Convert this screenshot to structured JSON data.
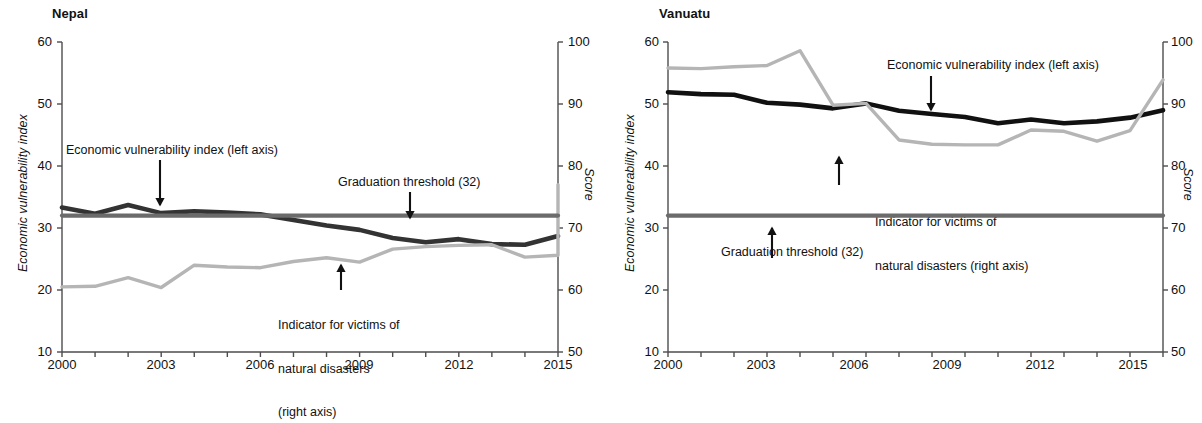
{
  "figure": {
    "background": "#ffffff",
    "series_colors": {
      "evi_dark": "#333333",
      "indicator_grey": "#b5b5b5",
      "threshold_grey": "#6b6b6b",
      "axis": "#4d4d4d"
    }
  },
  "panels": [
    {
      "id": "nepal",
      "title": "Nepal",
      "y_left_title": "Economic vulnerability index",
      "y_right_title": "Score",
      "annotations": [
        {
          "id": "evi",
          "text": "Economic vulnerability index (left axis)"
        },
        {
          "id": "threshold",
          "text": "Graduation threshold (32)"
        },
        {
          "id": "indicator",
          "line1": "Indicator for victims of",
          "line2": "natural disasters",
          "line3": "(right axis)"
        }
      ]
    },
    {
      "id": "vanuatu",
      "title": "Vanuatu",
      "y_left_title": "Economic vulnerability index",
      "y_right_title": "Score",
      "annotations": [
        {
          "id": "evi",
          "text": "Economic vulnerability index (left axis)"
        },
        {
          "id": "threshold",
          "text": "Graduation threshold (32)"
        },
        {
          "id": "indicator",
          "line1": "Indicator for victims of",
          "line2": "natural disasters (right axis)"
        }
      ]
    }
  ],
  "chart_data": [
    {
      "type": "line",
      "title": "Nepal",
      "xlabel": "",
      "ylabel": "Economic vulnerability index",
      "y2label": "Score",
      "xlim": [
        2000,
        2015
      ],
      "ylim": [
        10,
        60
      ],
      "y2lim": [
        50,
        100
      ],
      "yticks": [
        10,
        20,
        30,
        40,
        50,
        60
      ],
      "y2ticks": [
        50,
        60,
        70,
        80,
        90,
        100
      ],
      "xticks": [
        2000,
        2001,
        2002,
        2003,
        2004,
        2005,
        2006,
        2007,
        2008,
        2009,
        2010,
        2011,
        2012,
        2013,
        2014,
        2015
      ],
      "xticklabels": [
        "2000",
        "",
        "",
        "2003",
        "",
        "",
        "2006",
        "",
        "",
        "2009",
        "",
        "",
        "2012",
        "",
        "",
        "2015"
      ],
      "grid": false,
      "legend": "annotations-inline",
      "x": [
        2000,
        2001,
        2002,
        2003,
        2004,
        2005,
        2006,
        2007,
        2008,
        2009,
        2010,
        2011,
        2012,
        2013,
        2014,
        2015
      ],
      "series": [
        {
          "name": "Economic vulnerability index (left axis)",
          "axis": "left",
          "color": "#333333",
          "values": [
            33.3,
            32.3,
            33.7,
            32.4,
            32.7,
            32.5,
            32.2,
            31.3,
            30.4,
            29.7,
            28.4,
            27.7,
            28.2,
            27.4,
            27.3,
            28.7
          ]
        },
        {
          "name": "Indicator for victims of natural disasters (right axis)",
          "axis": "right",
          "color": "#b5b5b5",
          "values": [
            60.5,
            60.6,
            62.0,
            60.4,
            64.0,
            63.7,
            63.6,
            64.6,
            65.2,
            64.5,
            66.6,
            67.0,
            67.2,
            67.3,
            65.3,
            65.6
          ]
        },
        {
          "name": "Graduation threshold (32)",
          "axis": "left",
          "color": "#6b6b6b",
          "constant": 32,
          "values": [
            32,
            32,
            32,
            32,
            32,
            32,
            32,
            32,
            32,
            32,
            32,
            32,
            32,
            32,
            32,
            32
          ]
        }
      ],
      "extra_segment_note": "grey indicator rises steeply from 65.6 in 2014 to 77.0 in 2015",
      "indicator_2015": 77.0
    },
    {
      "type": "line",
      "title": "Vanuatu",
      "xlabel": "",
      "ylabel": "Economic vulnerability index",
      "y2label": "Score",
      "xlim": [
        2000,
        2015
      ],
      "ylim": [
        10,
        60
      ],
      "y2lim": [
        50,
        100
      ],
      "yticks": [
        10,
        20,
        30,
        40,
        50,
        60
      ],
      "y2ticks": [
        50,
        60,
        70,
        80,
        90,
        100
      ],
      "xticks": [
        2000,
        2001,
        2002,
        2003,
        2004,
        2005,
        2006,
        2007,
        2008,
        2009,
        2010,
        2011,
        2012,
        2013,
        2014,
        2015
      ],
      "xticklabels": [
        "2000",
        "",
        "",
        "2003",
        "",
        "",
        "2006",
        "",
        "",
        "2009",
        "",
        "",
        "2012",
        "",
        "",
        "2015"
      ],
      "grid": false,
      "legend": "annotations-inline",
      "x": [
        2000,
        2001,
        2002,
        2003,
        2004,
        2005,
        2006,
        2007,
        2008,
        2009,
        2010,
        2011,
        2012,
        2013,
        2014,
        2015
      ],
      "series": [
        {
          "name": "Economic vulnerability index (left axis)",
          "axis": "left",
          "color": "#111111",
          "values": [
            51.9,
            51.6,
            51.5,
            50.2,
            49.9,
            49.3,
            50.1,
            48.9,
            48.4,
            47.9,
            46.9,
            47.5,
            46.9,
            47.2,
            47.8,
            49.0
          ]
        },
        {
          "name": "Indicator for victims of natural disasters (right axis)",
          "axis": "right",
          "color": "#b5b5b5",
          "values": [
            95.8,
            95.7,
            96.0,
            96.2,
            98.6,
            89.8,
            90.1,
            84.2,
            83.5,
            83.4,
            83.4,
            85.8,
            85.6,
            84.0,
            85.7,
            93.9
          ]
        },
        {
          "name": "Graduation threshold (32)",
          "axis": "left",
          "color": "#6b6b6b",
          "constant": 32,
          "values": [
            32,
            32,
            32,
            32,
            32,
            32,
            32,
            32,
            32,
            32,
            32,
            32,
            32,
            32,
            32,
            32
          ]
        }
      ]
    }
  ]
}
